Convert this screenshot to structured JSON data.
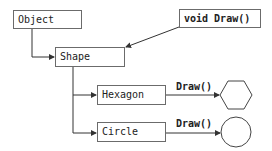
{
  "diagram": {
    "nodes": {
      "object": {
        "label": "Object"
      },
      "shape": {
        "label": "Shape"
      },
      "method": {
        "label": "void Draw()"
      },
      "hexagon": {
        "label": "Hexagon"
      },
      "circle": {
        "label": "Circle"
      }
    },
    "edges": {
      "hexagon_draw": {
        "label": "Draw()"
      },
      "circle_draw": {
        "label": "Draw()"
      }
    },
    "outputs": {
      "hexagon_shape": "hexagon",
      "circle_shape": "circle"
    },
    "colors": {
      "line": "#333333",
      "box_border": "#6b6b6b"
    }
  }
}
